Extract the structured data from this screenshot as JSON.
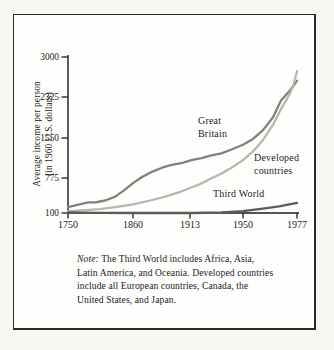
{
  "figure": {
    "y_axis_title": "Average income per person\n(in 1960 U.S. dollars)",
    "note_prefix": "Note:",
    "note_body": " The Third World includes Africa, Asia, Latin America, and Oceania. Developed countries include all European countries, Canada, the United States, and Japan."
  },
  "chart_data": {
    "type": "line",
    "title": "",
    "xlabel": "",
    "ylabel": "Average income per person (in 1960 U.S. dollars)",
    "x_ticks": [
      "1750",
      "1860",
      "1913",
      "1950",
      "1977"
    ],
    "y_ticks": [
      "100",
      "775",
      "1550",
      "2325",
      "3000"
    ],
    "ylim": [
      100,
      3000
    ],
    "grid": false,
    "legend": "inline curve labels",
    "x_scale_note": "year axis printed with non-linear spacing",
    "labels": {
      "great_britain": "Great\nBritain",
      "developed": "Developed\ncountries",
      "third_world": "Third World"
    },
    "colors": {
      "great_britain": "#85807c",
      "developed": "#b7b7b1",
      "third_world": "#5e5a57",
      "axis": "#1d1c1b"
    },
    "series": [
      {
        "name": "Great Britain",
        "key": "great_britain",
        "color": "#85807c",
        "points": [
          [
            1750,
            212
          ],
          [
            1784,
            304
          ],
          [
            1796,
            304
          ],
          [
            1813,
            342
          ],
          [
            1830,
            416
          ],
          [
            1846,
            546
          ],
          [
            1860,
            676
          ],
          [
            1868,
            788
          ],
          [
            1878,
            899
          ],
          [
            1887,
            974
          ],
          [
            1896,
            1030
          ],
          [
            1906,
            1067
          ],
          [
            1914,
            1122
          ],
          [
            1921,
            1160
          ],
          [
            1928,
            1215
          ],
          [
            1935,
            1253
          ],
          [
            1942,
            1327
          ],
          [
            1950,
            1420
          ],
          [
            1955,
            1532
          ],
          [
            1960,
            1699
          ],
          [
            1965,
            1941
          ],
          [
            1969,
            2257
          ],
          [
            1973,
            2420
          ],
          [
            1975,
            2500
          ],
          [
            1977,
            2600
          ]
        ]
      },
      {
        "name": "Developed countries",
        "key": "developed",
        "color": "#b7b7b1",
        "points": [
          [
            1750,
            137
          ],
          [
            1779,
            156
          ],
          [
            1804,
            174
          ],
          [
            1830,
            212
          ],
          [
            1860,
            267
          ],
          [
            1876,
            342
          ],
          [
            1890,
            416
          ],
          [
            1904,
            509
          ],
          [
            1913,
            583
          ],
          [
            1920,
            658
          ],
          [
            1928,
            769
          ],
          [
            1935,
            862
          ],
          [
            1942,
            974
          ],
          [
            1950,
            1122
          ],
          [
            1955,
            1290
          ],
          [
            1960,
            1513
          ],
          [
            1965,
            1800
          ],
          [
            1969,
            2100
          ],
          [
            1973,
            2350
          ],
          [
            1975,
            2500
          ],
          [
            1977,
            2760
          ]
        ]
      },
      {
        "name": "Third World",
        "key": "third_world",
        "color": "#5e5a57",
        "points": [
          [
            1750,
            110
          ],
          [
            1804,
            102
          ],
          [
            1860,
            100
          ],
          [
            1913,
            100
          ],
          [
            1935,
            110
          ],
          [
            1950,
            137
          ],
          [
            1960,
            184
          ],
          [
            1968,
            230
          ],
          [
            1977,
            295
          ]
        ]
      }
    ]
  }
}
